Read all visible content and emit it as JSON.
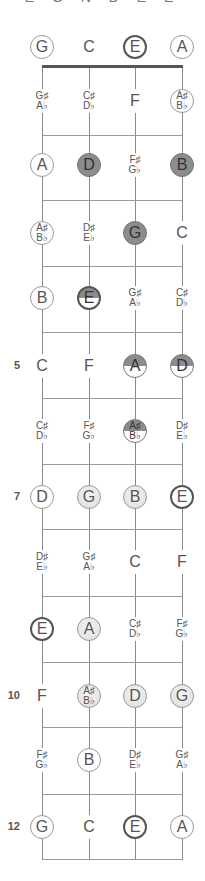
{
  "title": "E G N D E E",
  "layout": {
    "strings_x": [
      42,
      89,
      135,
      182
    ],
    "nut_y": 66,
    "fret_lines_y": [
      135,
      200,
      266,
      332,
      398,
      464,
      529,
      596,
      662,
      727,
      794,
      859
    ],
    "row_centers_y": [
      47,
      101,
      165,
      233,
      298,
      366,
      431,
      497,
      562,
      629,
      696,
      760,
      827
    ],
    "colors": {
      "dark_fill": "#8c8c8c",
      "light_fill": "#e2e2e2",
      "line": "#8a8a8a",
      "nut": "#555555"
    }
  },
  "fret_numbers": [
    {
      "fret": 5,
      "label": "5"
    },
    {
      "fret": 7,
      "label": "7"
    },
    {
      "fret": 10,
      "label": "10"
    },
    {
      "fret": 12,
      "label": "12"
    }
  ],
  "rows": [
    {
      "fret": 0,
      "notes": [
        {
          "n": "G",
          "s": "ring"
        },
        {
          "n": "C",
          "s": "plain"
        },
        {
          "n": "E",
          "s": "bold"
        },
        {
          "n": "A",
          "s": "ring"
        }
      ]
    },
    {
      "fret": 1,
      "notes": [
        {
          "n": "G♯",
          "b": "A♭",
          "s": "plain"
        },
        {
          "n": "C♯",
          "b": "D♭",
          "s": "plain"
        },
        {
          "n": "F",
          "s": "plain"
        },
        {
          "n": "A♯",
          "b": "B♭",
          "s": "ring"
        }
      ]
    },
    {
      "fret": 2,
      "notes": [
        {
          "n": "A",
          "s": "ring"
        },
        {
          "n": "D",
          "s": "dark"
        },
        {
          "n": "F♯",
          "b": "G♭",
          "s": "plain"
        },
        {
          "n": "B",
          "s": "dark"
        }
      ]
    },
    {
      "fret": 3,
      "notes": [
        {
          "n": "A♯",
          "b": "B♭",
          "s": "ring"
        },
        {
          "n": "D♯",
          "b": "E♭",
          "s": "plain"
        },
        {
          "n": "G",
          "s": "dark"
        },
        {
          "n": "C",
          "s": "plain"
        }
      ]
    },
    {
      "fret": 4,
      "notes": [
        {
          "n": "B",
          "s": "ring"
        },
        {
          "n": "E",
          "s": "halfbold"
        },
        {
          "n": "G♯",
          "b": "A♭",
          "s": "plain"
        },
        {
          "n": "C♯",
          "b": "D♭",
          "s": "plain"
        }
      ]
    },
    {
      "fret": 5,
      "notes": [
        {
          "n": "C",
          "s": "plain"
        },
        {
          "n": "F",
          "s": "plain"
        },
        {
          "n": "A",
          "s": "half"
        },
        {
          "n": "D",
          "s": "half"
        }
      ]
    },
    {
      "fret": 6,
      "notes": [
        {
          "n": "C♯",
          "b": "D♭",
          "s": "plain"
        },
        {
          "n": "F♯",
          "b": "G♭",
          "s": "plain"
        },
        {
          "n": "A♯",
          "b": "B♭",
          "s": "half"
        },
        {
          "n": "D♯",
          "b": "E♭",
          "s": "plain"
        }
      ]
    },
    {
      "fret": 7,
      "notes": [
        {
          "n": "D",
          "s": "ring"
        },
        {
          "n": "G",
          "s": "light"
        },
        {
          "n": "B",
          "s": "light"
        },
        {
          "n": "E",
          "s": "bold"
        }
      ]
    },
    {
      "fret": 8,
      "notes": [
        {
          "n": "D♯",
          "b": "E♭",
          "s": "plain"
        },
        {
          "n": "G♯",
          "b": "A♭",
          "s": "plain"
        },
        {
          "n": "C",
          "s": "plain"
        },
        {
          "n": "F",
          "s": "plain"
        }
      ]
    },
    {
      "fret": 9,
      "notes": [
        {
          "n": "E",
          "s": "bold"
        },
        {
          "n": "A",
          "s": "light"
        },
        {
          "n": "C♯",
          "b": "D♭",
          "s": "plain"
        },
        {
          "n": "F♯",
          "b": "G♭",
          "s": "plain"
        }
      ]
    },
    {
      "fret": 10,
      "notes": [
        {
          "n": "F",
          "s": "plain"
        },
        {
          "n": "A♯",
          "b": "B♭",
          "s": "light"
        },
        {
          "n": "D",
          "s": "light"
        },
        {
          "n": "G",
          "s": "light"
        }
      ]
    },
    {
      "fret": 11,
      "notes": [
        {
          "n": "F♯",
          "b": "G♭",
          "s": "plain"
        },
        {
          "n": "B",
          "s": "ring"
        },
        {
          "n": "D♯",
          "b": "E♭",
          "s": "plain"
        },
        {
          "n": "G♯",
          "b": "A♭",
          "s": "plain"
        }
      ]
    },
    {
      "fret": 12,
      "notes": [
        {
          "n": "G",
          "s": "ring"
        },
        {
          "n": "C",
          "s": "plain"
        },
        {
          "n": "E",
          "s": "bold"
        },
        {
          "n": "A",
          "s": "ring"
        }
      ]
    }
  ]
}
